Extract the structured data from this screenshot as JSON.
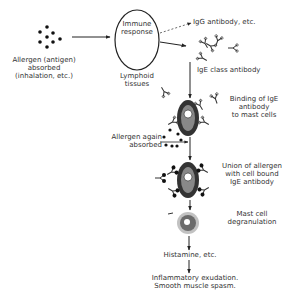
{
  "diagram": {
    "nodes": {
      "allergen_initial": {
        "line1": "Allergen (antigen)",
        "line2": "absorbed",
        "line3": "(inhalation, etc.)"
      },
      "immune_response": {
        "line1": "Immune",
        "line2": "response"
      },
      "lymphoid": {
        "line1": "Lymphoid",
        "line2": "tissues"
      },
      "igg": {
        "label": "IgG antibody, etc."
      },
      "ige": {
        "label": "IgE class antibody"
      },
      "binding": {
        "line1": "Binding of IgE",
        "line2": "antibody",
        "line3": "to mast cells"
      },
      "allergen_again": {
        "line1": "Allergen again",
        "line2": "absorbed"
      },
      "union": {
        "line1": "Union of allergen",
        "line2": "with cell bound",
        "line3": "IgE antibody"
      },
      "degranulation": {
        "line1": "Mast cell",
        "line2": "degranulation"
      },
      "histamine": {
        "label": "Histamine, etc."
      },
      "outcome": {
        "line1": "Inflammatory exudation.",
        "line2": "Smooth muscle spasm."
      }
    },
    "edges": [
      {
        "from": "allergen_initial",
        "to": "immune_response",
        "style": "solid"
      },
      {
        "from": "immune_response",
        "to": "igg",
        "style": "dashed"
      },
      {
        "from": "immune_response",
        "to": "ige",
        "style": "solid"
      },
      {
        "from": "ige",
        "to": "binding",
        "style": "solid"
      },
      {
        "from": "allergen_again",
        "to": "union",
        "style": "solid"
      },
      {
        "from": "binding",
        "to": "union",
        "style": "solid"
      },
      {
        "from": "union",
        "to": "degranulation",
        "style": "solid"
      },
      {
        "from": "degranulation",
        "to": "histamine",
        "style": "solid"
      },
      {
        "from": "histamine",
        "to": "outcome",
        "style": "solid"
      }
    ],
    "icons": [
      "allergen-dots-icon",
      "antibody-y-icon",
      "mast-cell-icon",
      "degranulated-cell-icon"
    ]
  }
}
